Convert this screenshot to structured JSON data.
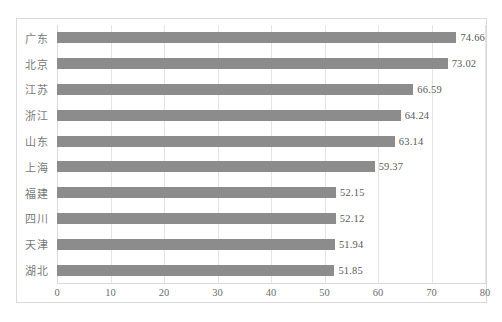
{
  "chart_data": {
    "type": "bar",
    "orientation": "horizontal",
    "title": "",
    "subtitle": "",
    "xlabel": "",
    "ylabel": "",
    "xlim": [
      0,
      80
    ],
    "xticks": [
      "0",
      "10",
      "20",
      "30",
      "40",
      "50",
      "60",
      "70",
      "80"
    ],
    "xtick_values": [
      0,
      10,
      20,
      30,
      40,
      50,
      60,
      70,
      80
    ],
    "grid": "vertical",
    "legend": "none",
    "bar_color": "#8c8c8c",
    "categories": [
      "广东",
      "北京",
      "江苏",
      "浙江",
      "山东",
      "上海",
      "福建",
      "四川",
      "天津",
      "湖北"
    ],
    "values": [
      74.66,
      73.02,
      66.59,
      64.24,
      63.14,
      59.37,
      52.15,
      52.12,
      51.94,
      51.85
    ],
    "data_labels": [
      "74.66",
      "73.02",
      "66.59",
      "64.24",
      "63.14",
      "59.37",
      "52.15",
      "52.12",
      "51.94",
      "51.85"
    ],
    "points": [
      {
        "category": "广东",
        "value": 74.66,
        "label": "74.66"
      },
      {
        "category": "北京",
        "value": 73.02,
        "label": "73.02"
      },
      {
        "category": "江苏",
        "value": 66.59,
        "label": "66.59"
      },
      {
        "category": "浙江",
        "value": 64.24,
        "label": "64.24"
      },
      {
        "category": "山东",
        "value": 63.14,
        "label": "63.14"
      },
      {
        "category": "上海",
        "value": 59.37,
        "label": "59.37"
      },
      {
        "category": "福建",
        "value": 52.15,
        "label": "52.15"
      },
      {
        "category": "四川",
        "value": 52.12,
        "label": "52.12"
      },
      {
        "category": "天津",
        "value": 51.94,
        "label": "51.94"
      },
      {
        "category": "湖北",
        "value": 51.85,
        "label": "51.85"
      }
    ]
  },
  "colors": {
    "bar": "#8c8c8c",
    "grid": "#e4e4e4",
    "frame": "#d9d9d9",
    "label_text": "#7a7a7a",
    "value_text": "#5a5a5a",
    "background": "#ffffff"
  }
}
